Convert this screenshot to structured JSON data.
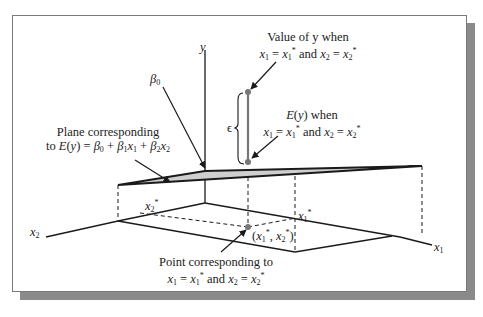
{
  "diagram": {
    "type": "3d-regression-plane",
    "axes": {
      "y": "y",
      "x1": "x1",
      "x2": "x2"
    },
    "annotations": {
      "value_of_y": {
        "line1": "Value of y when",
        "line2": "x1 = x1* and x2 = x2*"
      },
      "expected_y": {
        "line1": "E(y) when",
        "line2": "x1 = x1* and x2 = x2*"
      },
      "beta0": "β0",
      "plane": {
        "line1": "Plane corresponding",
        "line2": "to E(y) = β0 + β1x1 + β2x2"
      },
      "epsilon": "ϵ",
      "x2_star": "x2*",
      "x1_star": "x1*",
      "point_coords": "(x1*, x2*)",
      "point": {
        "line1": "Point corresponding to",
        "line2": "x1 = x1* and x2 = x2*"
      }
    },
    "colors": {
      "plane_fill": "#cfcfcf",
      "frame_shadow": "#8a8a8a",
      "line": "#1a1a1a",
      "point": "#777777"
    }
  }
}
